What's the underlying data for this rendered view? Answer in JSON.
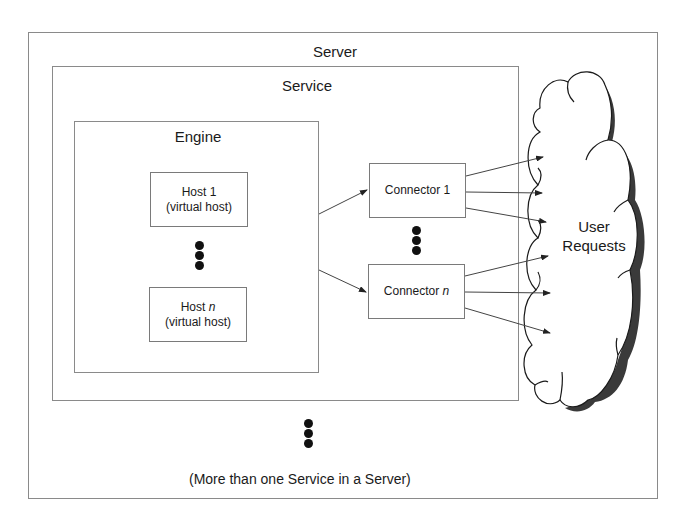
{
  "diagram": {
    "server": {
      "label": "Server"
    },
    "service": {
      "label": "Service"
    },
    "engine": {
      "label": "Engine",
      "hosts": [
        {
          "name": "Host 1",
          "subtitle": "(virtual host)"
        },
        {
          "name": "Host ",
          "name_var": "n",
          "subtitle": "(virtual host)"
        }
      ]
    },
    "connectors": [
      {
        "name": "Connector 1"
      },
      {
        "name": "Connector ",
        "name_var": "n"
      }
    ],
    "cloud": {
      "line1": "User",
      "line2": "Requests"
    },
    "caption": "(More than one Service in a Server)",
    "ellipsis": "⋮"
  }
}
